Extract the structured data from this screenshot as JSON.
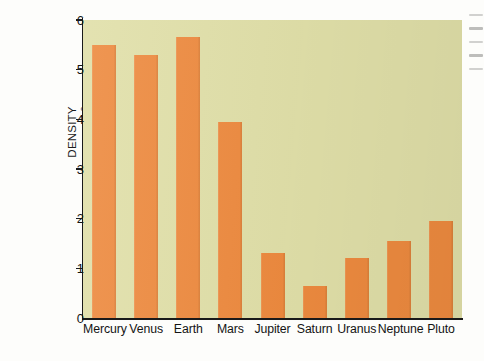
{
  "chart_data": {
    "type": "bar",
    "title": "",
    "xlabel": "",
    "ylabel": "DENSITY (gram/cm³)",
    "ylabel_line1": "DENSITY",
    "ylabel_line2_prefix": "(gram/cm",
    "ylabel_line2_sup": "3",
    "ylabel_line2_suffix": ")",
    "categories": [
      "Mercury",
      "Venus",
      "Earth",
      "Mars",
      "Jupiter",
      "Saturn",
      "Uranus",
      "Neptune",
      "Pluto"
    ],
    "values": [
      5.5,
      5.3,
      5.65,
      3.95,
      1.3,
      0.65,
      1.2,
      1.55,
      1.95
    ],
    "ylim": [
      0,
      6
    ],
    "yticks": [
      0,
      1,
      2,
      3,
      4,
      5,
      6
    ],
    "ytick_labels": [
      "0",
      "1",
      "2",
      "3",
      "4",
      "5",
      "6"
    ],
    "grid": false,
    "legend": null,
    "bar_color": "#ed8a3f",
    "plot_background": "#e0dfa8",
    "axis_color": "#1a1a1a",
    "text_color": "#141414"
  }
}
